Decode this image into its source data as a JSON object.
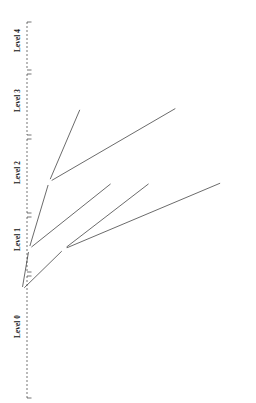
{
  "figure": {
    "axis_title": "Level",
    "node_fill_root": "#000000",
    "node_fill_other": "#ffffff",
    "stroke": "#1a1a1a"
  },
  "axis": {
    "levels": [
      {
        "label": "Level 4",
        "y_center": 44
      },
      {
        "label": "Level 3",
        "y_center": 104
      },
      {
        "label": "Level 2",
        "y_center": 176
      },
      {
        "label": "Level 1",
        "y_center": 243
      },
      {
        "label": "Level 0",
        "y_center": 330
      }
    ]
  },
  "tree": {
    "levels": [
      {
        "name": "level-4",
        "depth": 4,
        "prefix_length": 32,
        "y": 49,
        "label_orientation": "horizontal",
        "nodes": [
          {
            "label": "2C0F:FB20::/32",
            "x": 116,
            "filled": true
          }
        ]
      },
      {
        "name": "level-3",
        "depth": 3,
        "prefix_length": 33,
        "y": 107,
        "label_orientation": "horizontal",
        "nodes": [
          {
            "label": "2C0F:FB20::/33",
            "x": 81,
            "filled": false,
            "label_side": "left"
          },
          {
            "label": "2C0F:FB20:8000::/33",
            "x": 178,
            "filled": false,
            "label_side": "right"
          }
        ]
      },
      {
        "name": "level-2",
        "depth": 2,
        "prefix_length": 34,
        "y": 182,
        "label_orientation": "vertical",
        "nodes": [
          {
            "label": "2C0F:FB20::/34",
            "x": 49,
            "filled": false
          },
          {
            "label": "2C0F:FB20:4000::/34",
            "x": 113,
            "filled": false
          },
          {
            "label": "2C0F:FB20:8000::/34",
            "x": 151,
            "filled": false
          },
          {
            "label": "2C0F:FB20:C000::/34",
            "x": 223,
            "filled": false
          }
        ]
      },
      {
        "name": "level-1",
        "depth": 1,
        "prefix_length": 35,
        "y": 249,
        "label_orientation": "vertical",
        "nodes": [
          {
            "label": "2C0F:FB20::/35",
            "x": 29,
            "filled": false
          },
          {
            "label": "2C0F:FB20:2000::/35",
            "x": 64,
            "filled": false
          },
          {
            "label": "2C0F:FB20:4000::/35",
            "x": 91,
            "filled": false
          },
          {
            "label": "2C0F:FB20:6000::/35",
            "x": 126,
            "filled": false
          },
          {
            "label": "2C0F:FB20:8000::/35",
            "x": 139,
            "filled": false
          },
          {
            "label": "2C0F:FB20:A000::/35",
            "x": 172,
            "filled": false
          },
          {
            "label": "2C0F:FB20:C000::/35",
            "x": 201,
            "filled": false
          },
          {
            "label": "2C0F:FB20:E000::/35",
            "x": 234,
            "filled": false
          }
        ]
      },
      {
        "name": "level-0",
        "depth": 0,
        "prefix_length": 36,
        "y": 290,
        "label_orientation": "vertical",
        "nodes": [
          {
            "label": "2C0F:FB20::/36",
            "x": 22,
            "filled": false
          },
          {
            "label": "2C0F:FB20:1000::/36",
            "x": 36,
            "filled": false
          },
          {
            "label": "2C0F:FB20:2000::/36",
            "x": 51,
            "filled": false
          },
          {
            "label": "2C0F:FB20:3000::/36",
            "x": 65,
            "filled": false
          },
          {
            "label": "2C0F:FB20:4000::/36",
            "x": 79,
            "filled": false
          },
          {
            "label": "2C0F:FB20:5000::/36",
            "x": 94,
            "filled": false
          },
          {
            "label": "2C0F:FB20:6000::/36",
            "x": 108,
            "filled": false
          },
          {
            "label": "2C0F:FB20:7000::/36",
            "x": 123,
            "filled": false
          },
          {
            "label": "2C0F:FB20:8000::/36",
            "x": 137,
            "filled": false
          },
          {
            "label": "2C0F:FB20:9000::/36",
            "x": 152,
            "filled": false
          },
          {
            "label": "2C0F:FB20:A000::/36",
            "x": 166,
            "filled": false
          },
          {
            "label": "2C0F:FB20:B000::/36",
            "x": 181,
            "filled": false
          },
          {
            "label": "2C0F:FB20:C000::/36",
            "x": 195,
            "filled": false
          },
          {
            "label": "2C0F:FB20:D000::/36",
            "x": 210,
            "filled": false
          },
          {
            "label": "2C0F:FB20:E000::/36",
            "x": 224,
            "filled": false
          },
          {
            "label": "2C0F:FB20:F000::/36",
            "x": 239,
            "filled": false
          }
        ]
      }
    ],
    "edges": [
      {
        "from": [
          4,
          0
        ],
        "to": [
          3,
          0
        ]
      },
      {
        "from": [
          4,
          0
        ],
        "to": [
          3,
          1
        ]
      },
      {
        "from": [
          3,
          0
        ],
        "to": [
          2,
          0
        ]
      },
      {
        "from": [
          3,
          0
        ],
        "to": [
          2,
          1
        ]
      },
      {
        "from": [
          3,
          1
        ],
        "to": [
          2,
          2
        ]
      },
      {
        "from": [
          3,
          1
        ],
        "to": [
          2,
          3
        ]
      },
      {
        "from": [
          2,
          0
        ],
        "to": [
          1,
          0
        ]
      },
      {
        "from": [
          2,
          0
        ],
        "to": [
          1,
          1
        ]
      },
      {
        "from": [
          2,
          1
        ],
        "to": [
          1,
          2
        ]
      },
      {
        "from": [
          2,
          1
        ],
        "to": [
          1,
          3
        ]
      },
      {
        "from": [
          2,
          2
        ],
        "to": [
          1,
          4
        ]
      },
      {
        "from": [
          2,
          2
        ],
        "to": [
          1,
          5
        ]
      },
      {
        "from": [
          2,
          3
        ],
        "to": [
          1,
          6
        ]
      },
      {
        "from": [
          2,
          3
        ],
        "to": [
          1,
          7
        ]
      },
      {
        "from": [
          1,
          0
        ],
        "to": [
          0,
          0
        ]
      },
      {
        "from": [
          1,
          0
        ],
        "to": [
          0,
          1
        ]
      },
      {
        "from": [
          1,
          1
        ],
        "to": [
          0,
          2
        ]
      },
      {
        "from": [
          1,
          1
        ],
        "to": [
          0,
          3
        ]
      },
      {
        "from": [
          1,
          2
        ],
        "to": [
          0,
          4
        ]
      },
      {
        "from": [
          1,
          2
        ],
        "to": [
          0,
          5
        ]
      },
      {
        "from": [
          1,
          3
        ],
        "to": [
          0,
          6
        ]
      },
      {
        "from": [
          1,
          3
        ],
        "to": [
          0,
          7
        ]
      },
      {
        "from": [
          1,
          4
        ],
        "to": [
          0,
          8
        ]
      },
      {
        "from": [
          1,
          4
        ],
        "to": [
          0,
          9
        ]
      },
      {
        "from": [
          1,
          5
        ],
        "to": [
          0,
          10
        ]
      },
      {
        "from": [
          1,
          5
        ],
        "to": [
          0,
          11
        ]
      },
      {
        "from": [
          1,
          6
        ],
        "to": [
          0,
          12
        ]
      },
      {
        "from": [
          1,
          6
        ],
        "to": [
          0,
          13
        ]
      },
      {
        "from": [
          1,
          7
        ],
        "to": [
          0,
          14
        ]
      },
      {
        "from": [
          1,
          7
        ],
        "to": [
          0,
          15
        ]
      }
    ]
  }
}
